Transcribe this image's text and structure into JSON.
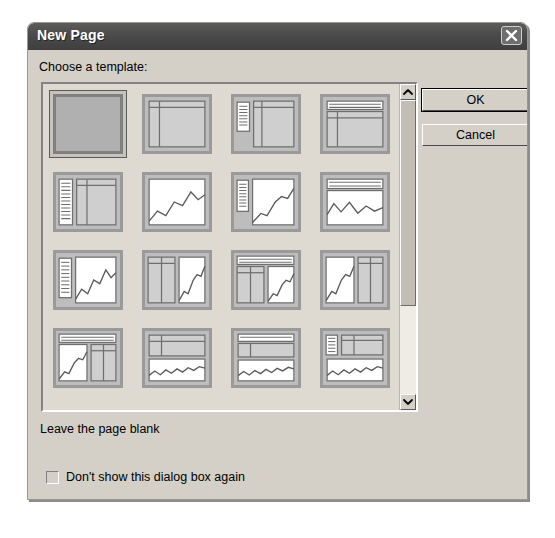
{
  "dialog": {
    "title": "New Page",
    "close_icon": "close-x-icon"
  },
  "prompt": {
    "label": "Choose a template:"
  },
  "buttons": {
    "ok": "OK",
    "cancel": "Cancel"
  },
  "description": {
    "text": "Leave the page blank"
  },
  "checkbox": {
    "label": "Don't show this dialog box again",
    "checked": false
  },
  "scrollbar": {
    "up_icon": "chevron-up-icon",
    "down_icon": "chevron-down-icon",
    "thumb_position_percent": 0,
    "thumb_size_percent": 70
  },
  "templates": {
    "selected_index": 0,
    "rows": [
      [
        {
          "name": "blank-page",
          "kind": "blank"
        },
        {
          "name": "two-column-text",
          "kind": "two-col"
        },
        {
          "name": "list-and-two-columns",
          "kind": "list-two-col"
        },
        {
          "name": "header-and-two-columns",
          "kind": "header-two-col"
        }
      ],
      [
        {
          "name": "text-panel-and-columns",
          "kind": "text-panel-cols"
        },
        {
          "name": "full-chart",
          "kind": "chart-full"
        },
        {
          "name": "list-and-chart",
          "kind": "list-chart"
        },
        {
          "name": "header-and-chart",
          "kind": "header-chart"
        }
      ],
      [
        {
          "name": "side-text-and-chart",
          "kind": "sidetext-chart"
        },
        {
          "name": "columns-and-chart",
          "kind": "cols-chart"
        },
        {
          "name": "header-columns-and-chart",
          "kind": "header-cols-chart"
        },
        {
          "name": "chart-and-columns",
          "kind": "chart-cols"
        }
      ],
      [
        {
          "name": "header-chart-and-table",
          "kind": "header-chart-table"
        },
        {
          "name": "table-over-wide-chart",
          "kind": "table-wide-chart"
        },
        {
          "name": "header-table-and-wide-chart",
          "kind": "header-table-chart"
        },
        {
          "name": "list-table-and-wide-chart",
          "kind": "list-table-chart"
        }
      ]
    ]
  },
  "colors": {
    "dialog_face": "#d4d0c8",
    "titlebar": "#4a4a4a",
    "listbox_face": "#dedad2",
    "thumb_border": "#9a9a9a",
    "thumb_face": "#bdbdbd"
  }
}
